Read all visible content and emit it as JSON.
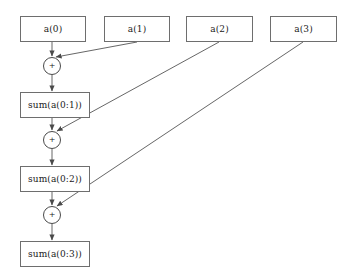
{
  "diagram": {
    "type": "dataflow-diagram",
    "background_color": "#ffffff",
    "box_border_color": "#6e6e6e",
    "edge_color": "#555555",
    "text_color": "#1a1a1a",
    "inputs": [
      {
        "id": "a0",
        "label": "a(0)",
        "x": 20,
        "y": 16,
        "w": 66,
        "h": 26
      },
      {
        "id": "a1",
        "label": "a(1)",
        "x": 104,
        "y": 16,
        "w": 66,
        "h": 26
      },
      {
        "id": "a2",
        "label": "a(2)",
        "x": 186,
        "y": 16,
        "w": 67,
        "h": 26
      },
      {
        "id": "a3",
        "label": "a(3)",
        "x": 270,
        "y": 16,
        "w": 67,
        "h": 26
      }
    ],
    "operators": [
      {
        "id": "plus1",
        "label": "+",
        "cx": 52,
        "cy": 66,
        "r": 9
      },
      {
        "id": "plus2",
        "label": "+",
        "cx": 52,
        "cy": 140,
        "r": 9
      },
      {
        "id": "plus3",
        "label": "+",
        "cx": 52,
        "cy": 215,
        "r": 9
      }
    ],
    "accumulators": [
      {
        "id": "sum01",
        "label": "sum(a(0:1))",
        "x": 20,
        "y": 92,
        "w": 70,
        "h": 26
      },
      {
        "id": "sum02",
        "label": "sum(a(0:2))",
        "x": 20,
        "y": 166,
        "w": 70,
        "h": 26
      },
      {
        "id": "sum03",
        "label": "sum(a(0:3))",
        "x": 20,
        "y": 241,
        "w": 70,
        "h": 26
      }
    ],
    "edges": [
      {
        "id": "e-a0-plus1",
        "from": "a0",
        "to": "plus1",
        "x1": 52,
        "y1": 42,
        "x2": 52,
        "y2": 56,
        "kind": "vertical"
      },
      {
        "id": "e-a1-plus1",
        "from": "a1",
        "to": "plus1",
        "x1": 137,
        "y1": 42,
        "x2": 56,
        "y2": 57,
        "kind": "diagonal"
      },
      {
        "id": "e-plus1-sum01",
        "from": "plus1",
        "to": "sum01",
        "x1": 52,
        "y1": 75,
        "x2": 52,
        "y2": 91,
        "kind": "vertical"
      },
      {
        "id": "e-sum01-plus2",
        "from": "sum01",
        "to": "plus2",
        "x1": 52,
        "y1": 118,
        "x2": 52,
        "y2": 130,
        "kind": "vertical"
      },
      {
        "id": "e-a2-plus2",
        "from": "a2",
        "to": "plus2",
        "x1": 219,
        "y1": 42,
        "x2": 57,
        "y2": 131,
        "kind": "diagonal"
      },
      {
        "id": "e-plus2-sum02",
        "from": "plus2",
        "to": "sum02",
        "x1": 52,
        "y1": 149,
        "x2": 52,
        "y2": 165,
        "kind": "vertical"
      },
      {
        "id": "e-sum02-plus3",
        "from": "sum02",
        "to": "plus3",
        "x1": 52,
        "y1": 192,
        "x2": 52,
        "y2": 205,
        "kind": "vertical"
      },
      {
        "id": "e-a3-plus3",
        "from": "a3",
        "to": "plus3",
        "x1": 303,
        "y1": 42,
        "x2": 57,
        "y2": 206,
        "kind": "diagonal"
      },
      {
        "id": "e-plus3-sum03",
        "from": "plus3",
        "to": "sum03",
        "x1": 52,
        "y1": 224,
        "x2": 52,
        "y2": 240,
        "kind": "vertical"
      }
    ]
  }
}
